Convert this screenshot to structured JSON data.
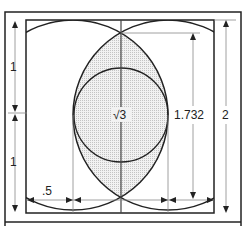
{
  "diagram": {
    "labels": {
      "upper_half": "1",
      "lower_half": "1",
      "half_width": ".5",
      "root_three": "√3",
      "lens_height": "1.732",
      "total_height": "2"
    },
    "colors": {
      "line": "#222222",
      "guide": "#999999",
      "fill": "#d9d9d9"
    }
  }
}
